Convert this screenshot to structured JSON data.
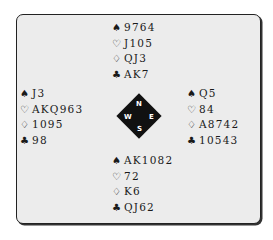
{
  "suits": {
    "spades": "♠",
    "hearts": "♡",
    "diamonds": "♢",
    "clubs": "♣"
  },
  "hands": {
    "north": {
      "spades": "9764",
      "hearts": "J105",
      "diamonds": "QJ3",
      "clubs": "AK7"
    },
    "west": {
      "spades": "J3",
      "hearts": "AKQ963",
      "diamonds": "1095",
      "clubs": "98"
    },
    "east": {
      "spades": "Q5",
      "hearts": "84",
      "diamonds": "A8742",
      "clubs": "10543"
    },
    "south": {
      "spades": "AK1082",
      "hearts": "72",
      "diamonds": "K6",
      "clubs": "QJ62"
    }
  },
  "compass": {
    "n": "N",
    "e": "E",
    "s": "S",
    "w": "W"
  },
  "colors": {
    "frame_bg": "#ececec",
    "border": "#222222",
    "compass": "#111111"
  }
}
